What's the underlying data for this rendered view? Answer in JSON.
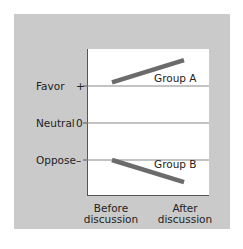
{
  "chart_data": {
    "type": "line",
    "title": "",
    "xlabel": "",
    "ylabel": "",
    "categories": [
      "Before discussion",
      "After discussion"
    ],
    "y_ticks": [
      {
        "label": "Favor",
        "symbol": "+",
        "value": 1
      },
      {
        "label": "Neutral",
        "symbol": "0",
        "value": 0
      },
      {
        "label": "Oppose",
        "symbol": "–",
        "value": -1
      }
    ],
    "ylim": [
      -2,
      2
    ],
    "grid": true,
    "series": [
      {
        "name": "Group A",
        "values": [
          1.1,
          1.7
        ]
      },
      {
        "name": "Group B",
        "values": [
          -1.0,
          -1.6
        ]
      }
    ]
  },
  "labels": {
    "favor": "Favor",
    "favor_symbol": "+",
    "neutral": "Neutral",
    "neutral_symbol": "0",
    "oppose": "Oppose",
    "oppose_symbol": "–",
    "group_a": "Group A",
    "group_b": "Group B",
    "before_line1": "Before",
    "before_line2": "discussion",
    "after_line1": "After",
    "after_line2": "discussion"
  },
  "colors": {
    "panel": "#cacaca",
    "plot": "#ffffff",
    "series_line": "#6b6b6b",
    "gridline": "#888888"
  }
}
